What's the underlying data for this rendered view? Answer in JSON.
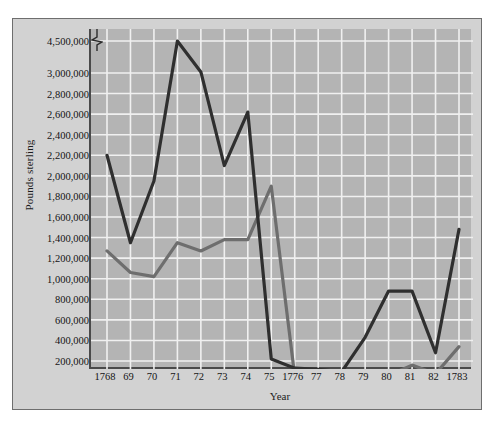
{
  "chart_data": {
    "type": "line",
    "title": "",
    "xlabel": "Year",
    "ylabel": "Pounds sterling",
    "grid": true,
    "legend": "none",
    "axis_break": {
      "between": [
        3000000,
        4500000
      ],
      "note": "y-axis broken above 3,000,000"
    },
    "x": [
      "1768",
      "69",
      "70",
      "71",
      "72",
      "73",
      "74",
      "75",
      "1776",
      "77",
      "78",
      "79",
      "80",
      "81",
      "82",
      "1783"
    ],
    "categories": [
      "1768",
      "69",
      "70",
      "71",
      "72",
      "73",
      "74",
      "75",
      "1776",
      "77",
      "78",
      "79",
      "80",
      "81",
      "82",
      "1783"
    ],
    "ytick_labels": [
      "4,500,000",
      "3,000,000",
      "2,800,000",
      "2,600,000",
      "2,400,000",
      "2,200,000",
      "2,000,000",
      "1,800,000",
      "1,600,000",
      "1,400,000",
      "1,200,000",
      "1,000,000",
      "800,000",
      "600,000",
      "400,000",
      "200,000"
    ],
    "ytick_values": [
      4500000,
      3000000,
      2800000,
      2600000,
      2400000,
      2200000,
      2000000,
      1800000,
      1600000,
      1400000,
      1200000,
      1000000,
      800000,
      600000,
      400000,
      200000
    ],
    "ylim": [
      0,
      4500000
    ],
    "series": [
      {
        "name": "dark-series",
        "color": "#2f2f2f",
        "values": [
          2200000,
          1350000,
          1950000,
          4500000,
          3050000,
          2100000,
          2620000,
          220000,
          130000,
          120000,
          95000,
          430000,
          880000,
          880000,
          280000,
          1480000
        ]
      },
      {
        "name": "gray-series",
        "color": "#6e6e6e",
        "values": [
          1270000,
          1060000,
          1020000,
          1350000,
          1270000,
          1380000,
          1380000,
          1900000,
          55000,
          45000,
          45000,
          50000,
          60000,
          160000,
          75000,
          340000
        ]
      }
    ]
  },
  "colors": {
    "page_background": "#ffffff",
    "figure_background": "#d2d2d2",
    "plot_background": "#b4b4b4",
    "gridline": "#f0f0f0",
    "axis": "#4a4a4a",
    "text": "#141414"
  }
}
